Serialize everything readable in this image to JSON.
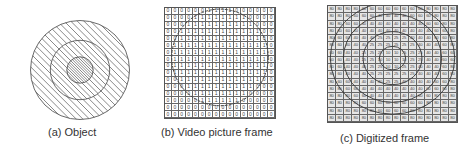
{
  "panels": [
    {
      "id": "a",
      "caption": "(a) Object",
      "shape": {
        "cx": 50,
        "cy": 50,
        "rings": [
          {
            "r": 45,
            "hatch_spacing": 6
          },
          {
            "r": 27,
            "hatch_spacing": 5
          },
          {
            "r": 12,
            "hatch_spacing": 2.5
          }
        ],
        "hatch_color": "#666666",
        "stroke_color": "#555555"
      }
    },
    {
      "id": "b",
      "caption": "(b) Video picture frame",
      "grid_size": 16,
      "circle": {
        "cx": 8,
        "cy": 7.2,
        "r": 6.9
      },
      "cell_rule": "1 inside circle, 0 outside",
      "values_legend": [
        "0",
        "1"
      ]
    },
    {
      "id": "c",
      "caption": "(c) Digitized frame",
      "grid_size": 16,
      "center": {
        "cx": 8,
        "cy": 7.2
      },
      "levels": [
        {
          "max_r": 1.6,
          "value": "10"
        },
        {
          "max_r": 3.6,
          "value": "25"
        },
        {
          "max_r": 6.0,
          "value": "40"
        },
        {
          "max_r": 7.6,
          "value": "60"
        },
        {
          "max_r": 99,
          "value": "80"
        }
      ],
      "circles_r": [
        1.6,
        3.6,
        6.0,
        7.6
      ]
    }
  ]
}
